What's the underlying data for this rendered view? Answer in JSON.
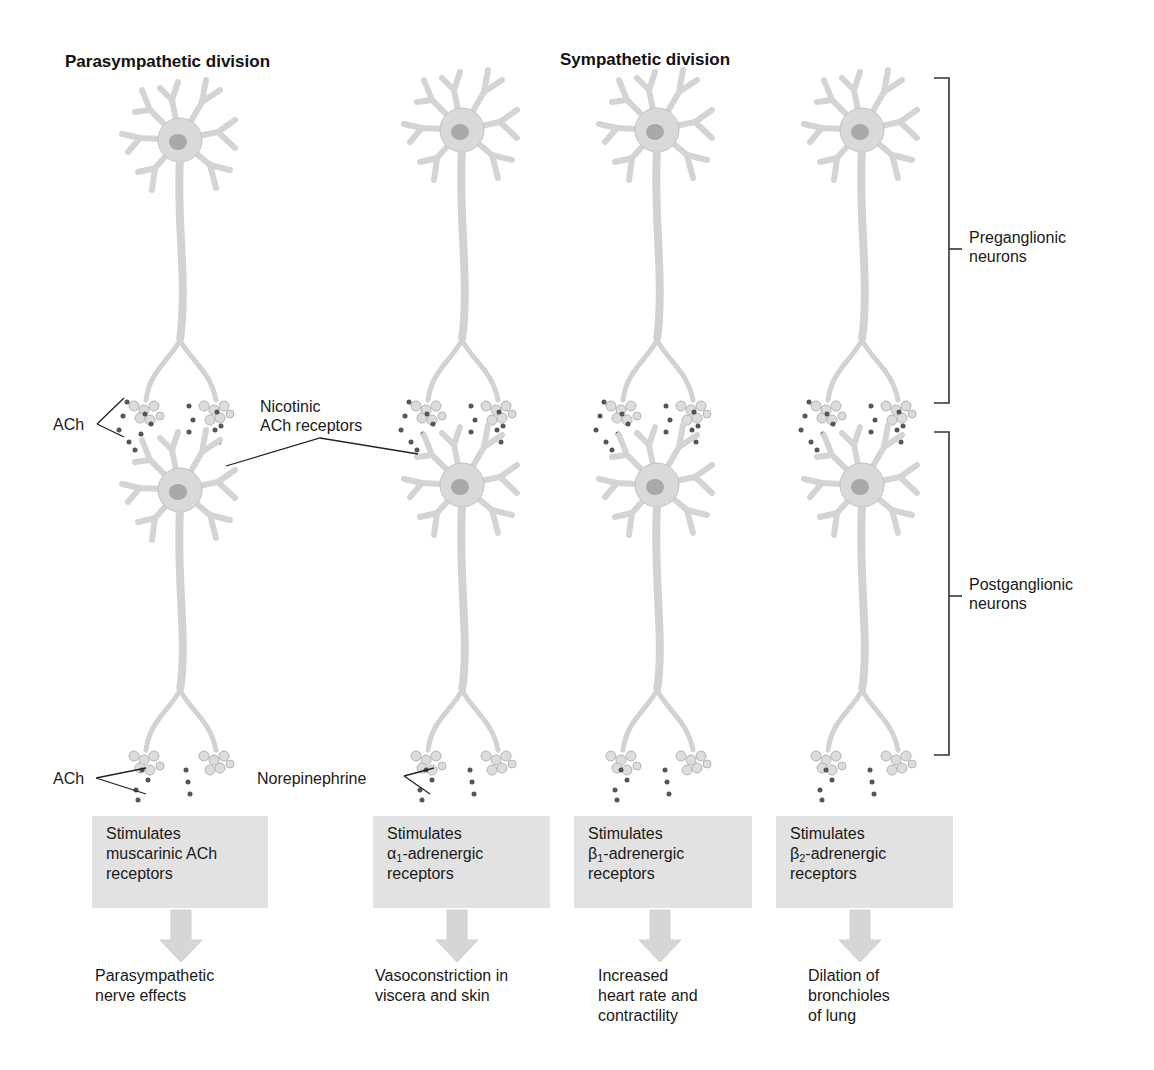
{
  "headings": {
    "parasympathetic": "Parasympathetic division",
    "sympathetic": "Sympathetic division"
  },
  "brackets": {
    "preganglionic": [
      "Preganglionic",
      "neurons"
    ],
    "postganglionic": [
      "Postganglionic",
      "neurons"
    ]
  },
  "labels": {
    "ach_top": "ACh",
    "nicotinic": [
      "Nicotinic",
      "ACh receptors"
    ],
    "ach_bottom": "ACh",
    "norepinephrine": "Norepinephrine"
  },
  "columns": [
    {
      "id": "parasympathetic",
      "box": {
        "line1": "Stimulates",
        "line2_prefix": "muscarinic ACh",
        "line2_sub": "",
        "line2_suffix": "",
        "line3": "receptors"
      },
      "effect": [
        "Parasympathetic",
        "nerve effects"
      ]
    },
    {
      "id": "alpha1",
      "box": {
        "line1": "Stimulates",
        "line2_prefix": "α",
        "line2_sub": "1",
        "line2_suffix": "-adrenergic",
        "line3": "receptors"
      },
      "effect": [
        "Vasoconstriction in",
        "viscera and skin"
      ]
    },
    {
      "id": "beta1",
      "box": {
        "line1": "Stimulates",
        "line2_prefix": "β",
        "line2_sub": "1",
        "line2_suffix": "-adrenergic",
        "line3": "receptors"
      },
      "effect": [
        "Increased",
        "heart rate and",
        "contractility"
      ]
    },
    {
      "id": "beta2",
      "box": {
        "line1": "Stimulates",
        "line2_prefix": "β",
        "line2_sub": "2",
        "line2_suffix": "-adrenergic",
        "line3": "receptors"
      },
      "effect": [
        "Dilation of",
        "bronchioles",
        "of lung"
      ]
    }
  ],
  "colors": {
    "neuron_fill": "#d9d9d9",
    "neuron_edge": "#b8b8b8",
    "nucleus": "#a9a9a9",
    "vesicle": "#555555",
    "box_fill": "#e2e2e2",
    "arrow_fill": "#d6d6d6",
    "line": "#222222"
  }
}
